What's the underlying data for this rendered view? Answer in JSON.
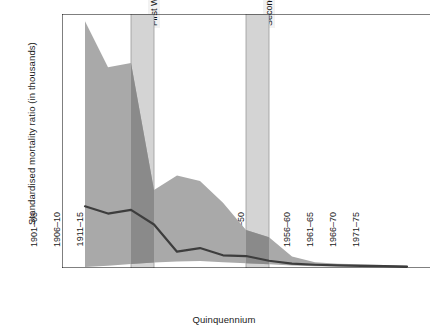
{
  "chart_data": {
    "type": "area",
    "title": "",
    "xlabel": "Quinquennium",
    "ylabel": "Standardised mortality ratio (in thousands)",
    "ylim": [
      0,
      70
    ],
    "yticks": [
      0,
      10,
      20,
      30,
      40,
      50,
      60,
      70
    ],
    "grid": false,
    "legend_position": "none",
    "categories": [
      "1901–05",
      "1906–10",
      "1911–15",
      "1916–20",
      "1921–25",
      "1926–30",
      "1931–35",
      "1936–40",
      "1941–45",
      "1946–50",
      "1951–55",
      "1956–60",
      "1961–65",
      "1966–70",
      "1971–75"
    ],
    "series": [
      {
        "name": "Upper bound",
        "values": [
          68.0,
          55.3,
          56.5,
          21.5,
          25.5,
          24.0,
          18.0,
          10.5,
          8.5,
          3.2,
          1.6,
          1.2,
          1.0,
          0.8,
          0.6
        ]
      },
      {
        "name": "Median",
        "values": [
          17.0,
          15.0,
          16.0,
          12.0,
          4.5,
          5.5,
          3.5,
          3.3,
          2.0,
          1.2,
          0.9,
          0.7,
          0.6,
          0.5,
          0.4
        ]
      },
      {
        "name": "Lower bound",
        "values": [
          0.3,
          0.6,
          1.1,
          1.5,
          1.8,
          1.9,
          1.6,
          1.3,
          1.0,
          0.7,
          0.5,
          0.4,
          0.35,
          0.3,
          0.25
        ]
      }
    ],
    "annotations": [
      {
        "label": "First World War",
        "from": "1911–15",
        "to": "1916–20"
      },
      {
        "label": "Second World War",
        "from": "1936–40",
        "to": "1941–45"
      }
    ],
    "colors": {
      "band_fill": "#a9a9a9",
      "band_fill_in_war": "#8a8a8a",
      "median_line": "#3d3d3d",
      "war_band": "#d4d4d4",
      "axis": "#000000",
      "text": "#1a1a1a"
    }
  }
}
